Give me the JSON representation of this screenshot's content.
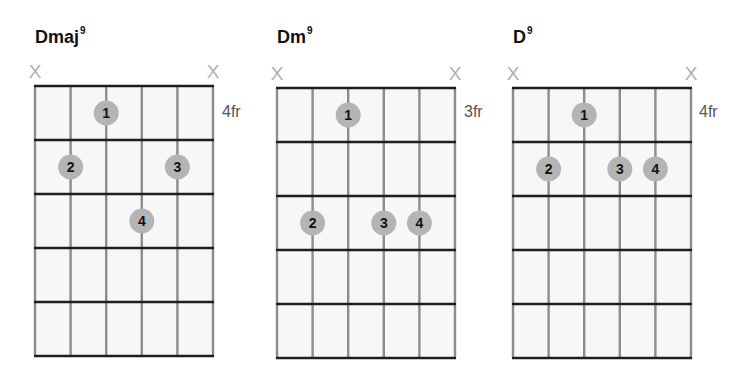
{
  "colors": {
    "fret_line": "#1e1e1e",
    "string_line": "#8c8c8c",
    "grid_bg": "#f7f7f7",
    "dot_fill": "#b4b4b4",
    "dot_text": "#111111",
    "mute_mark": "#b0b0b0",
    "fr_label": "#555555"
  },
  "chords": [
    {
      "name": "Dmaj",
      "superscript": "9",
      "start_fret_label": "4fr",
      "muted_strings": [
        1,
        6
      ],
      "mute_symbol": "X",
      "fingers": [
        {
          "finger": "1",
          "string": 3,
          "fret": 1
        },
        {
          "finger": "2",
          "string": 2,
          "fret": 2
        },
        {
          "finger": "3",
          "string": 5,
          "fret": 2
        },
        {
          "finger": "4",
          "string": 4,
          "fret": 3
        }
      ]
    },
    {
      "name": "Dm",
      "superscript": "9",
      "start_fret_label": "3fr",
      "muted_strings": [
        1,
        6
      ],
      "mute_symbol": "X",
      "fingers": [
        {
          "finger": "1",
          "string": 3,
          "fret": 1
        },
        {
          "finger": "2",
          "string": 2,
          "fret": 3
        },
        {
          "finger": "3",
          "string": 4,
          "fret": 3
        },
        {
          "finger": "4",
          "string": 5,
          "fret": 3
        }
      ]
    },
    {
      "name": "D",
      "superscript": "9",
      "start_fret_label": "4fr",
      "muted_strings": [
        1,
        6
      ],
      "mute_symbol": "X",
      "fingers": [
        {
          "finger": "1",
          "string": 3,
          "fret": 1
        },
        {
          "finger": "2",
          "string": 2,
          "fret": 2
        },
        {
          "finger": "3",
          "string": 4,
          "fret": 2
        },
        {
          "finger": "4",
          "string": 5,
          "fret": 2
        }
      ]
    }
  ]
}
